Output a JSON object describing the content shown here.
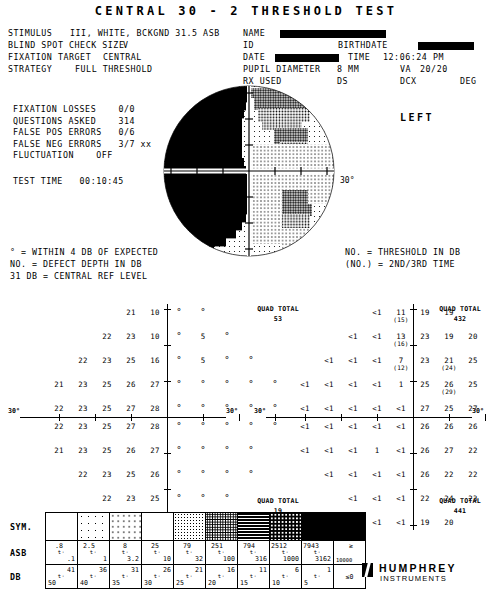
{
  "title": "CENTRAL 30 - 2 THRESHOLD TEST",
  "header": {
    "stimulus_label": "STIMULUS",
    "stimulus_value": "III, WHITE, BCKGND 31.5 ASB",
    "blind_spot_label": "BLIND SPOT CHECK SIZE",
    "blind_spot_value": "V",
    "fixation_target_label": "FIXATION TARGET",
    "fixation_target_value": "CENTRAL",
    "strategy_label": "STRATEGY",
    "strategy_value": "FULL THRESHOLD",
    "name_label": "NAME",
    "id_label": "ID",
    "birthdate_label": "BIRTHDATE",
    "date_label": "DATE",
    "time_label": "TIME",
    "time_value": "12:06:24 PM",
    "pupil_label": "PUPIL DIAMETER",
    "pupil_value": "8 MM",
    "va_label": "VA",
    "va_value": "20/20",
    "rx_label": "RX USED",
    "ds_label": "DS",
    "dcx_label": "DCX",
    "deg_label": "DEG"
  },
  "reliability": {
    "fixation_losses_label": "FIXATION LOSSES",
    "fixation_losses_value": "0/0",
    "questions_asked_label": "QUESTIONS ASKED",
    "questions_asked_value": "314",
    "false_pos_label": "FALSE POS ERRORS",
    "false_pos_value": "0/6",
    "false_neg_label": "FALSE NEG ERRORS",
    "false_neg_value": "3/7 xx",
    "fluctuation_label": "FLUCTUATION",
    "fluctuation_value": "OFF",
    "test_time_label": "TEST TIME",
    "test_time_value": "00:10:45"
  },
  "eye_label": "LEFT",
  "degree_label_left": "30°",
  "degree_label_right": "30°",
  "key_left": [
    "° = WITHIN 4 DB OF EXPECTED",
    "NO. = DEFECT DEPTH IN DB",
    "31 DB    = CENTRAL REF LEVEL"
  ],
  "key_right": [
    "NO.  = THRESHOLD IN DB",
    "(NO.) = 2ND/3RD TIME"
  ],
  "grid_left": {
    "name": "defect-depth-grid",
    "axis_label_left": "30°",
    "axis_label_right": "30°",
    "rows": [
      {
        "y": 12,
        "cells": [
          {
            "x": 131,
            "v": "21"
          },
          {
            "x": 155,
            "v": "10"
          },
          {
            "x": 179,
            "v": "°"
          },
          {
            "x": 203,
            "v": "°"
          }
        ]
      },
      {
        "y": 36,
        "cells": [
          {
            "x": 107,
            "v": "22"
          },
          {
            "x": 131,
            "v": "23"
          },
          {
            "x": 155,
            "v": "10"
          },
          {
            "x": 179,
            "v": "°"
          },
          {
            "x": 203,
            "v": "5"
          },
          {
            "x": 227,
            "v": "°"
          }
        ]
      },
      {
        "y": 60,
        "cells": [
          {
            "x": 83,
            "v": "22"
          },
          {
            "x": 107,
            "v": "23"
          },
          {
            "x": 131,
            "v": "25"
          },
          {
            "x": 155,
            "v": "16"
          },
          {
            "x": 179,
            "v": "°"
          },
          {
            "x": 203,
            "v": "5"
          },
          {
            "x": 227,
            "v": "°"
          },
          {
            "x": 251,
            "v": "°"
          }
        ]
      },
      {
        "y": 84,
        "cells": [
          {
            "x": 59,
            "v": "21"
          },
          {
            "x": 83,
            "v": "23"
          },
          {
            "x": 107,
            "v": "25"
          },
          {
            "x": 131,
            "v": "26"
          },
          {
            "x": 155,
            "v": "27"
          },
          {
            "x": 179,
            "v": "°"
          },
          {
            "x": 203,
            "v": "°"
          },
          {
            "x": 227,
            "v": "°"
          },
          {
            "x": 251,
            "v": "°"
          },
          {
            "x": 275,
            "v": "°"
          }
        ]
      },
      {
        "y": 108,
        "cells": [
          {
            "x": 59,
            "v": "22"
          },
          {
            "x": 83,
            "v": "23"
          },
          {
            "x": 107,
            "v": "25"
          },
          {
            "x": 131,
            "v": "27"
          },
          {
            "x": 155,
            "v": "28"
          },
          {
            "x": 179,
            "v": "°"
          },
          {
            "x": 203,
            "v": "°"
          },
          {
            "x": 227,
            "v": "°"
          },
          {
            "x": 251,
            "v": "°"
          },
          {
            "x": 275,
            "v": "°"
          }
        ]
      },
      {
        "y": 126,
        "cells": [
          {
            "x": 59,
            "v": "22"
          },
          {
            "x": 83,
            "v": "23"
          },
          {
            "x": 107,
            "v": "25"
          },
          {
            "x": 131,
            "v": "27"
          },
          {
            "x": 155,
            "v": "28"
          },
          {
            "x": 179,
            "v": "°"
          },
          {
            "x": 203,
            "v": "°"
          },
          {
            "x": 227,
            "v": "°"
          },
          {
            "x": 251,
            "v": "°"
          },
          {
            "x": 275,
            "v": "°"
          }
        ]
      },
      {
        "y": 150,
        "cells": [
          {
            "x": 59,
            "v": "21"
          },
          {
            "x": 83,
            "v": "23"
          },
          {
            "x": 107,
            "v": "25"
          },
          {
            "x": 131,
            "v": "26"
          },
          {
            "x": 155,
            "v": "27"
          },
          {
            "x": 179,
            "v": "°"
          },
          {
            "x": 203,
            "v": "°"
          },
          {
            "x": 227,
            "v": "°"
          },
          {
            "x": 251,
            "v": "°"
          }
        ]
      },
      {
        "y": 174,
        "cells": [
          {
            "x": 83,
            "v": "22"
          },
          {
            "x": 107,
            "v": "23"
          },
          {
            "x": 131,
            "v": "25"
          },
          {
            "x": 155,
            "v": "26"
          },
          {
            "x": 179,
            "v": "°"
          },
          {
            "x": 203,
            "v": "°"
          },
          {
            "x": 227,
            "v": "°"
          },
          {
            "x": 251,
            "v": "°"
          }
        ]
      },
      {
        "y": 198,
        "cells": [
          {
            "x": 107,
            "v": "22"
          },
          {
            "x": 131,
            "v": "23"
          },
          {
            "x": 155,
            "v": "25"
          },
          {
            "x": 179,
            "v": "°"
          },
          {
            "x": 203,
            "v": "°"
          },
          {
            "x": 227,
            "v": "°"
          }
        ]
      },
      {
        "y": 222,
        "cells": [
          {
            "x": 131,
            "v": "21"
          },
          {
            "x": 155,
            "v": "22"
          },
          {
            "x": 179,
            "v": "°"
          },
          {
            "x": 203,
            "v": "°"
          }
        ]
      }
    ]
  },
  "grid_right": {
    "name": "threshold-grid",
    "axis_label_left": "30°",
    "axis_label_right": "30°",
    "quad_totals": [
      {
        "label": "QUAD TOTAL",
        "value": "53",
        "pos": "top-left"
      },
      {
        "label": "QUAD TOTAL",
        "value": "432",
        "pos": "top-right"
      },
      {
        "label": "QUAD TOTAL",
        "value": "19",
        "pos": "bottom-left"
      },
      {
        "label": "QUAD TOTAL",
        "value": "441",
        "pos": "bottom-right"
      }
    ],
    "rows": [
      {
        "y": 12,
        "cells": [
          {
            "x": 131,
            "v": "<1"
          },
          {
            "x": 155,
            "v": "11",
            "p": "(15)"
          },
          {
            "x": 179,
            "v": "19"
          },
          {
            "x": 203,
            "v": "19"
          }
        ]
      },
      {
        "y": 36,
        "cells": [
          {
            "x": 107,
            "v": "<1"
          },
          {
            "x": 131,
            "v": "<1"
          },
          {
            "x": 155,
            "v": "13",
            "p": "(16)"
          },
          {
            "x": 179,
            "v": "23"
          },
          {
            "x": 203,
            "v": "19"
          },
          {
            "x": 227,
            "v": "20"
          }
        ]
      },
      {
        "y": 60,
        "cells": [
          {
            "x": 83,
            "v": "<1"
          },
          {
            "x": 107,
            "v": "<1"
          },
          {
            "x": 131,
            "v": "<1"
          },
          {
            "x": 155,
            "v": "7",
            "p": "(12)"
          },
          {
            "x": 179,
            "v": "23"
          },
          {
            "x": 203,
            "v": "21",
            "p": "(24)"
          },
          {
            "x": 227,
            "v": "25"
          },
          {
            "x": 251,
            "v": "20"
          }
        ]
      },
      {
        "y": 84,
        "cells": [
          {
            "x": 59,
            "v": "<1"
          },
          {
            "x": 83,
            "v": "<1"
          },
          {
            "x": 107,
            "v": "<1"
          },
          {
            "x": 131,
            "v": "<1"
          },
          {
            "x": 155,
            "v": "1"
          },
          {
            "x": 179,
            "v": "25"
          },
          {
            "x": 203,
            "v": "26",
            "p": "(29)"
          },
          {
            "x": 227,
            "v": "25"
          },
          {
            "x": 251,
            "v": "21"
          },
          {
            "x": 275,
            "v": "21"
          }
        ]
      },
      {
        "y": 108,
        "cells": [
          {
            "x": 59,
            "v": "<1"
          },
          {
            "x": 83,
            "v": "<1"
          },
          {
            "x": 107,
            "v": "<1"
          },
          {
            "x": 131,
            "v": "<1"
          },
          {
            "x": 155,
            "v": "<1"
          },
          {
            "x": 179,
            "v": "27"
          },
          {
            "x": 203,
            "v": "25"
          },
          {
            "x": 227,
            "v": "27"
          },
          {
            "x": 251,
            "v": "25"
          },
          {
            "x": 275,
            "v": "21"
          }
        ]
      },
      {
        "y": 126,
        "cells": [
          {
            "x": 59,
            "v": "<1"
          },
          {
            "x": 83,
            "v": "<1"
          },
          {
            "x": 107,
            "v": "<1"
          },
          {
            "x": 131,
            "v": "<1"
          },
          {
            "x": 155,
            "v": "<1"
          },
          {
            "x": 179,
            "v": "26"
          },
          {
            "x": 203,
            "v": "26"
          },
          {
            "x": 227,
            "v": "26"
          },
          {
            "x": 251,
            "v": "22"
          },
          {
            "x": 275,
            "v": "21"
          }
        ]
      },
      {
        "y": 150,
        "cells": [
          {
            "x": 59,
            "v": "<1"
          },
          {
            "x": 83,
            "v": "<1"
          },
          {
            "x": 107,
            "v": "<1"
          },
          {
            "x": 131,
            "v": "1"
          },
          {
            "x": 155,
            "v": "<1"
          },
          {
            "x": 179,
            "v": "26"
          },
          {
            "x": 203,
            "v": "27"
          },
          {
            "x": 227,
            "v": "22"
          },
          {
            "x": 251,
            "v": "22"
          }
        ]
      },
      {
        "y": 174,
        "cells": [
          {
            "x": 83,
            "v": "<1"
          },
          {
            "x": 107,
            "v": "<1"
          },
          {
            "x": 131,
            "v": "<1"
          },
          {
            "x": 155,
            "v": "<1"
          },
          {
            "x": 179,
            "v": "26"
          },
          {
            "x": 203,
            "v": "22"
          },
          {
            "x": 227,
            "v": "22"
          },
          {
            "x": 251,
            "v": "18"
          }
        ]
      },
      {
        "y": 198,
        "cells": [
          {
            "x": 107,
            "v": "<1"
          },
          {
            "x": 131,
            "v": "<1"
          },
          {
            "x": 155,
            "v": "<1"
          },
          {
            "x": 179,
            "v": "22"
          },
          {
            "x": 203,
            "v": "24"
          },
          {
            "x": 227,
            "v": "23"
          }
        ]
      },
      {
        "y": 222,
        "cells": [
          {
            "x": 131,
            "v": "<1"
          },
          {
            "x": 155,
            "v": "<1"
          },
          {
            "x": 179,
            "v": "19"
          },
          {
            "x": 203,
            "v": "20"
          }
        ]
      }
    ]
  },
  "symbol_table": {
    "row_labels": {
      "sym": "SYM.",
      "asb": "ASB",
      "db": "DB"
    },
    "columns": [
      {
        "swatch": "sw0",
        "asb_top": ".8",
        "asb_bot": ".1",
        "db_top": "41",
        "db_bot": "50"
      },
      {
        "swatch": "sw1",
        "asb_top": "2.5",
        "asb_bot": "1",
        "db_top": "36",
        "db_bot": "40"
      },
      {
        "swatch": "sw2",
        "asb_top": "8",
        "asb_bot": "3.2",
        "db_top": "31",
        "db_bot": "35"
      },
      {
        "swatch": "sw3",
        "asb_top": "25",
        "asb_bot": "10",
        "db_top": "26",
        "db_bot": "30"
      },
      {
        "swatch": "sw4",
        "asb_top": "79",
        "asb_bot": "32",
        "db_top": "21",
        "db_bot": "25"
      },
      {
        "swatch": "sw5",
        "asb_top": "251",
        "asb_bot": "100",
        "db_top": "16",
        "db_bot": "20"
      },
      {
        "swatch": "sw6",
        "asb_top": "794",
        "asb_bot": "316",
        "db_top": "11",
        "db_bot": "15"
      },
      {
        "swatch": "sw7",
        "asb_top": "2512",
        "asb_bot": "1000",
        "db_top": "6",
        "db_bot": "10"
      },
      {
        "swatch": "sw8",
        "asb_top": "7943",
        "asb_bot": "3162",
        "db_top": "1",
        "db_bot": "5"
      },
      {
        "swatch": "sw9",
        "asb_single": "≥",
        "asb_bot": "10000",
        "db_single": "≤0"
      }
    ],
    "range_mark": "t·"
  },
  "logo": {
    "top": "HUMPHREY",
    "bottom": "INSTRUMENTS"
  }
}
